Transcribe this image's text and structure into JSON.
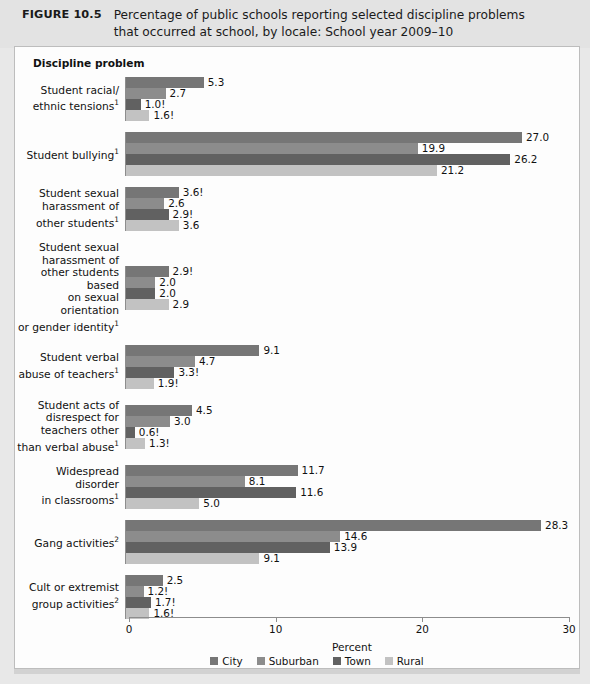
{
  "figure": {
    "label": "FIGURE 10.5",
    "title_line1": "Percentage of public schools reporting selected discipline problems",
    "title_line2": "that occurred at school, by locale: School year 2009–10",
    "axis_title": "Discipline problem"
  },
  "colors": {
    "city": "#767676",
    "suburban": "#8c8c8c",
    "town": "#616161",
    "rural": "#c2c2c2",
    "panel_background": "#fdfdfd",
    "header_background": "#e3e3e3",
    "axis_line": "#8d8d8d"
  },
  "chart_data": {
    "type": "bar",
    "orientation": "horizontal",
    "title": "Percentage of public schools reporting selected discipline problems that occurred at school, by locale: School year 2009–10",
    "xlabel": "Percent",
    "ylabel": "Discipline problem",
    "xlim": [
      0,
      30
    ],
    "xticks": [
      0,
      10,
      20,
      30
    ],
    "xtick_labels": [
      "0",
      "10",
      "20",
      "30"
    ],
    "grid": false,
    "legend_position": "bottom",
    "categories": [
      "Student racial/ ethnic tensions¹",
      "Student bullying¹",
      "Student sexual harassment of other students¹",
      "Student sexual harassment of other students based on sexual orientation or gender identity¹",
      "Student verbal abuse of teachers¹",
      "Student acts of disrespect for teachers other than verbal abuse¹",
      "Widespread disorder in classrooms¹",
      "Gang activities²",
      "Cult or extremist group activities²"
    ],
    "series": [
      {
        "name": "City",
        "values": [
          5.3,
          27.0,
          3.6,
          2.9,
          9.1,
          4.5,
          11.7,
          28.3,
          2.5
        ]
      },
      {
        "name": "Suburban",
        "values": [
          2.7,
          19.9,
          2.6,
          2.0,
          4.7,
          3.0,
          8.1,
          14.6,
          1.2
        ]
      },
      {
        "name": "Town",
        "values": [
          1.0,
          26.2,
          2.9,
          2.0,
          3.3,
          0.6,
          11.6,
          13.9,
          1.7
        ]
      },
      {
        "name": "Rural",
        "values": [
          1.6,
          21.2,
          3.6,
          2.9,
          1.9,
          1.3,
          5.0,
          9.1,
          1.6
        ]
      }
    ],
    "data_labels": [
      {
        "values": [
          "5.3",
          "2.7",
          "1.0!",
          "1.6!"
        ]
      },
      {
        "values": [
          "27.0",
          "19.9",
          "26.2",
          "21.2"
        ]
      },
      {
        "values": [
          "3.6!",
          "2.6",
          "2.9!",
          "3.6"
        ]
      },
      {
        "values": [
          "2.9!",
          "2.0",
          "2.0",
          "2.9"
        ]
      },
      {
        "values": [
          "9.1",
          "4.7",
          "3.3!",
          "1.9!"
        ]
      },
      {
        "values": [
          "4.5",
          "3.0",
          "0.6!",
          "1.3!"
        ]
      },
      {
        "values": [
          "11.7",
          "8.1",
          "11.6",
          "5.0"
        ]
      },
      {
        "values": [
          "28.3",
          "14.6",
          "13.9",
          "9.1"
        ]
      },
      {
        "values": [
          "2.5",
          "1.2!",
          "1.7!",
          "1.6!"
        ]
      }
    ]
  },
  "categories_html": [
    "Student racial/<br>ethnic tensions<sup>1</sup>",
    "Student bullying<sup>1</sup>",
    "Student sexual<br>harassment of<br>other students<sup>1</sup>",
    "Student sexual<br>harassment of<br>other students based<br>on sexual orientation<br>or gender identity<sup>1</sup>",
    "Student verbal<br>abuse of teachers<sup>1</sup>",
    "Student acts of<br>disrespect for<br>teachers other<br>than verbal abuse<sup>1</sup>",
    "Widespread disorder<br>in classrooms<sup>1</sup>",
    "Gang activities<sup>2</sup>",
    "Cult or extremist<br>group activities<sup>2</sup>"
  ],
  "axis": {
    "x_label": "Percent",
    "ticks": [
      "0",
      "10",
      "20",
      "30"
    ]
  },
  "legend": {
    "items": [
      {
        "label": "City",
        "color": "#767676"
      },
      {
        "label": "Suburban",
        "color": "#8c8c8c"
      },
      {
        "label": "Town",
        "color": "#616161"
      },
      {
        "label": "Rural",
        "color": "#c2c2c2"
      }
    ]
  }
}
